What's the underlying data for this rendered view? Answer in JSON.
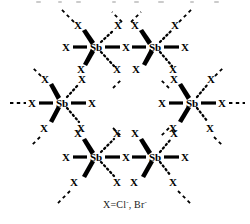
{
  "figure": {
    "kind": "chemical-structure-diagram",
    "metal_label": "Sb",
    "ligand_label": "X",
    "bond_colors": {
      "bond": "#000000",
      "extension": "#000000"
    },
    "background": "#ffffff"
  },
  "caption": {
    "prefix": "X=Cl",
    "charge1": "-",
    "middle": ", Br",
    "charge2": "-"
  },
  "lattice": {
    "centers": [
      {
        "id": "sb-top-left",
        "label": "Sb",
        "x": 96,
        "y": 50
      },
      {
        "id": "sb-top-right",
        "label": "Sb",
        "x": 155,
        "y": 50
      },
      {
        "id": "sb-mid-left",
        "label": "Sb",
        "x": 62,
        "y": 106
      },
      {
        "id": "sb-mid-right",
        "label": "Sb",
        "x": 192,
        "y": 106
      },
      {
        "id": "sb-bottom-left",
        "label": "Sb",
        "x": 96,
        "y": 160
      },
      {
        "id": "sb-bottom-right",
        "label": "Sb",
        "x": 155,
        "y": 160
      }
    ],
    "ligands": [
      {
        "id": "x-top-row-left-terminal",
        "label": "X",
        "x": 66,
        "y": 50
      },
      {
        "id": "x-top-row-bridge",
        "label": "X",
        "x": 126,
        "y": 50
      },
      {
        "id": "x-top-row-right-terminal",
        "label": "X",
        "x": 185,
        "y": 50
      },
      {
        "id": "x-mid-row-left-terminal",
        "label": "X",
        "x": 32,
        "y": 106
      },
      {
        "id": "x-mid-row-left-inner",
        "label": "X",
        "x": 92,
        "y": 106
      },
      {
        "id": "x-mid-row-right-inner",
        "label": "X",
        "x": 162,
        "y": 106
      },
      {
        "id": "x-mid-row-right-terminal",
        "label": "X",
        "x": 222,
        "y": 106
      },
      {
        "id": "x-bot-row-left-terminal",
        "label": "X",
        "x": 66,
        "y": 160
      },
      {
        "id": "x-bot-row-bridge",
        "label": "X",
        "x": 126,
        "y": 160
      },
      {
        "id": "x-bot-row-right-terminal",
        "label": "X",
        "x": 185,
        "y": 160
      },
      {
        "id": "x-tl-upper-left",
        "label": "X",
        "x": 78,
        "y": 27
      },
      {
        "id": "x-tl-upper-right",
        "label": "X",
        "x": 118,
        "y": 27
      },
      {
        "id": "x-tl-lower-left",
        "label": "X",
        "x": 81,
        "y": 82
      },
      {
        "id": "x-tl-lower-right",
        "label": "X",
        "x": 117,
        "y": 82
      },
      {
        "id": "x-tr-upper-left",
        "label": "X",
        "x": 135,
        "y": 27
      },
      {
        "id": "x-tr-upper-right",
        "label": "X",
        "x": 175,
        "y": 27
      },
      {
        "id": "x-tr-lower-left",
        "label": "X",
        "x": 136,
        "y": 82
      },
      {
        "id": "x-tr-lower-right",
        "label": "X",
        "x": 173,
        "y": 82
      },
      {
        "id": "x-ml-upper-left",
        "label": "X",
        "x": 45,
        "y": 81
      },
      {
        "id": "x-ml-upper-right",
        "label": "X",
        "x": 82,
        "y": 81
      },
      {
        "id": "x-ml-lower-left",
        "label": "X",
        "x": 44,
        "y": 132
      },
      {
        "id": "x-ml-lower-right",
        "label": "X",
        "x": 81,
        "y": 132
      },
      {
        "id": "x-mr-upper-left",
        "label": "X",
        "x": 174,
        "y": 81
      },
      {
        "id": "x-mr-upper-right",
        "label": "X",
        "x": 211,
        "y": 81
      },
      {
        "id": "x-mr-lower-left",
        "label": "X",
        "x": 173,
        "y": 132
      },
      {
        "id": "x-mr-lower-right",
        "label": "X",
        "x": 210,
        "y": 132
      },
      {
        "id": "x-bl-upper-left",
        "label": "X",
        "x": 78,
        "y": 136
      },
      {
        "id": "x-bl-upper-right",
        "label": "X",
        "x": 117,
        "y": 136
      },
      {
        "id": "x-bl-lower-left",
        "label": "X",
        "x": 74,
        "y": 186
      },
      {
        "id": "x-bl-lower-right",
        "label": "X",
        "x": 117,
        "y": 186
      },
      {
        "id": "x-br-upper-left",
        "label": "X",
        "x": 135,
        "y": 136
      },
      {
        "id": "x-br-upper-right",
        "label": "X",
        "x": 174,
        "y": 136
      },
      {
        "id": "x-br-lower-left",
        "label": "X",
        "x": 134,
        "y": 186
      },
      {
        "id": "x-br-lower-right",
        "label": "X",
        "x": 173,
        "y": 186
      }
    ],
    "bond_styles": {
      "solid": "in-plane sigma bond drawn as a heavy solid line",
      "wedge": "bond projecting toward the viewer drawn as a filled tapered wedge",
      "hashed": "bond projecting away from the viewer drawn as a dotted line",
      "dashed_extension": "dashed line showing the lattice continues"
    }
  }
}
